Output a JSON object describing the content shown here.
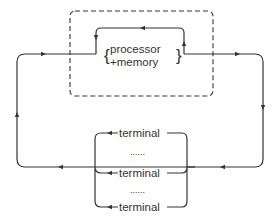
{
  "diagram": {
    "colors": {
      "stroke": "#333333",
      "background": "#ffffff"
    },
    "boundary": {
      "style": "dashed",
      "label": ""
    },
    "central_unit": {
      "line1": "processor",
      "line2": "+memory"
    },
    "terminals": [
      {
        "label": "terminal"
      },
      {
        "label": "terminal"
      },
      {
        "label": "terminal"
      }
    ],
    "ellipsis": [
      "......",
      "......"
    ]
  }
}
